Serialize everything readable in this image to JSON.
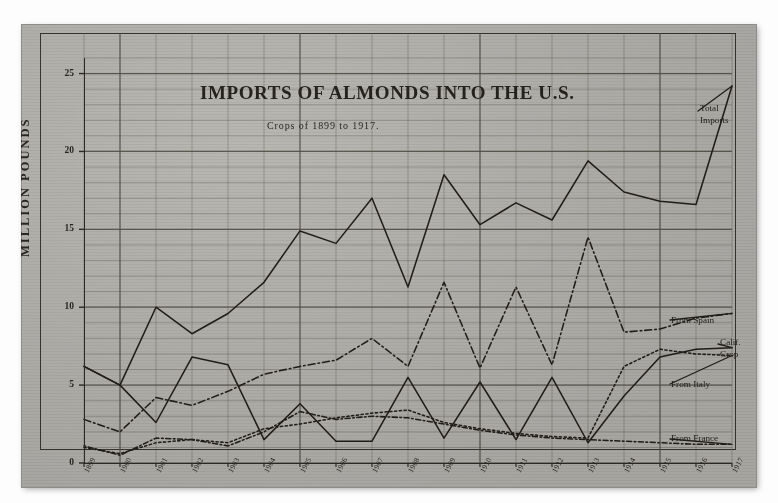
{
  "chart_data": {
    "type": "line",
    "title": "IMPORTS OF ALMONDS INTO THE U.S.",
    "subtitle": "Crops of 1899 to 1917.",
    "ylabel": "MILLION POUNDS",
    "xlabel": "",
    "ylim": [
      0,
      26
    ],
    "yticks": [
      0,
      5,
      10,
      15,
      20,
      25
    ],
    "grid": true,
    "grid_minor_step": 1,
    "grid_major_step": 5,
    "legend": "inline-right-labels",
    "categories": [
      "1899",
      "1900",
      "1901",
      "1902",
      "1903",
      "1904",
      "1905",
      "1906",
      "1907",
      "1908",
      "1909",
      "1910",
      "1911",
      "1912",
      "1913",
      "1914",
      "1915",
      "1916",
      "1917"
    ],
    "series": [
      {
        "name": "Total Imports",
        "style": "solid",
        "values": [
          6.2,
          5.0,
          10.0,
          8.3,
          9.6,
          11.6,
          14.9,
          14.1,
          17.0,
          11.3,
          18.5,
          15.3,
          16.7,
          15.6,
          19.4,
          17.4,
          16.8,
          16.6,
          24.2
        ]
      },
      {
        "name": "From Spain",
        "style": "dash-dot",
        "values": [
          2.8,
          2.0,
          4.2,
          3.7,
          4.6,
          5.7,
          6.2,
          6.6,
          8.0,
          6.2,
          11.6,
          6.1,
          11.3,
          6.3,
          14.5,
          8.4,
          8.6,
          9.3,
          9.6
        ]
      },
      {
        "name": "From Italy",
        "style": "dotted",
        "values": [
          1.0,
          0.6,
          1.3,
          1.5,
          1.3,
          2.2,
          2.5,
          2.9,
          3.2,
          3.4,
          2.6,
          2.2,
          1.9,
          1.7,
          1.6,
          6.2,
          7.3,
          7.0,
          6.9
        ]
      },
      {
        "name": "From France",
        "style": "dot-dash-fine",
        "values": [
          1.1,
          0.5,
          1.6,
          1.5,
          1.1,
          2.0,
          3.3,
          2.8,
          3.0,
          2.9,
          2.5,
          2.1,
          1.8,
          1.6,
          1.5,
          1.4,
          1.3,
          1.2,
          1.2
        ]
      },
      {
        "name": "Calif. Crop",
        "style": "solid",
        "values": [
          6.2,
          5.0,
          2.6,
          6.8,
          6.3,
          1.5,
          3.8,
          1.4,
          1.4,
          5.5,
          1.6,
          5.2,
          1.5,
          5.5,
          1.3,
          4.3,
          6.8,
          7.3,
          7.4
        ]
      }
    ]
  },
  "labels": {
    "total_imports_l1": "Total",
    "total_imports_l2": "Imports",
    "from_spain": "From Spain",
    "calif_crop_l1": "Calif.",
    "calif_crop_l2": "Crop",
    "from_italy": "From Italy",
    "from_france": "From France"
  }
}
